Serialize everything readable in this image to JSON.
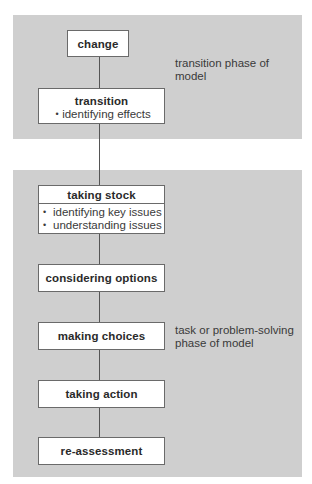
{
  "diagram": {
    "type": "flowchart",
    "colors": {
      "panel_background": "#cfcfcf",
      "box_background": "#ffffff",
      "box_border": "#6a6a6a",
      "connector": "#555555",
      "text": "#2a2a2a"
    },
    "phases": [
      {
        "id": "transition",
        "label": "transition phase of model",
        "steps": [
          {
            "title": "change",
            "bullets": []
          },
          {
            "title": "transition",
            "bullets": [
              "identifying effects"
            ]
          }
        ]
      },
      {
        "id": "task",
        "label": "task or problem-solving phase of model",
        "steps": [
          {
            "title": "taking stock",
            "bullets": [
              "identifying key issues",
              "understanding issues"
            ]
          },
          {
            "title": "considering options",
            "bullets": []
          },
          {
            "title": "making choices",
            "bullets": []
          },
          {
            "title": "taking action",
            "bullets": []
          },
          {
            "title": "re-assessment",
            "bullets": []
          }
        ]
      }
    ],
    "flow": [
      "change",
      "transition",
      "taking stock",
      "considering options",
      "making choices",
      "taking action",
      "re-assessment"
    ]
  }
}
